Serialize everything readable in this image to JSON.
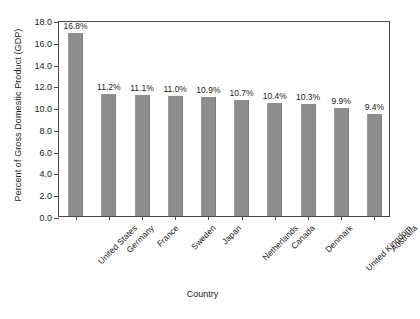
{
  "chart_data": {
    "type": "bar",
    "title": "",
    "xlabel": "Country",
    "ylabel": "Percent of Gross Domestic Product (GDP)",
    "categories": [
      "United States",
      "Germany",
      "France",
      "Sweden",
      "Japan",
      "Netherlands",
      "Canada",
      "Denmark",
      "United Kingdom",
      "Australia"
    ],
    "values": [
      16.8,
      11.2,
      11.1,
      11.0,
      10.9,
      10.7,
      10.4,
      10.3,
      9.9,
      9.4
    ],
    "value_labels": [
      "16.8%",
      "11.2%",
      "11.1%",
      "11.0%",
      "10.9%",
      "10.7%",
      "10.4%",
      "10.3%",
      "9.9%",
      "9.4%"
    ],
    "ylim": [
      0.0,
      18.0
    ],
    "ytick_values": [
      0.0,
      2.0,
      4.0,
      6.0,
      8.0,
      10.0,
      12.0,
      14.0,
      16.0,
      18.0
    ],
    "ytick_labels": [
      "0.0",
      "2.0",
      "4.0",
      "6.0",
      "8.0",
      "10.0",
      "12.0",
      "14.0",
      "16.0",
      "18.0"
    ],
    "grid": false,
    "legend": "none",
    "bar_color": "#8d8d8d",
    "axis_color": "#4a4a4a",
    "background_color": "#ffffff"
  }
}
